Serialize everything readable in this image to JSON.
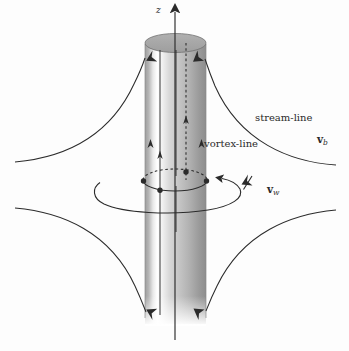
{
  "figure": {
    "background_color": "#fdfdfd",
    "ink_color": "#2b2b2b",
    "cylinder": {
      "surface_light": "#ffffff",
      "surface_mid": "#c9c9c9",
      "surface_dark": "#8f8f8f",
      "cap_fill": "#a8a8a8",
      "cap_edge": "#6f6f6f"
    }
  },
  "labels": {
    "axis_z": "z",
    "stream_line": "stream-line",
    "vortex_line": "vortex-line",
    "velocity_b": "v",
    "velocity_b_sub": "b",
    "velocity_w": "v",
    "velocity_w_sub": "w"
  },
  "geometry": {
    "cylinder_left_x": 145,
    "cylinder_right_x": 206,
    "cylinder_top_y": 40,
    "cylinder_bottom_y": 322,
    "cap_ry": 9,
    "axis_x": 175,
    "axis_top_y": 8,
    "axis_bottom_y": 340,
    "dashed_line_x": 186,
    "inner_line_left_x": 160,
    "inner_line_right_x": 176,
    "ring_center_x": 175,
    "ring_center_y": 180,
    "ring_rx": 32,
    "ring_ry": 11,
    "circulation_center_x": 167,
    "circulation_center_y": 193,
    "circulation_rx": 74,
    "circulation_ry": 20
  },
  "label_positions": {
    "axis_z": {
      "x": 156,
      "y": 7
    },
    "stream_line": {
      "x": 255,
      "y": 118
    },
    "vortex_line": {
      "x": 205,
      "y": 143
    },
    "velocity_b": {
      "x": 318,
      "y": 138
    },
    "velocity_w": {
      "x": 268,
      "y": 188
    }
  },
  "elements": {
    "vortex_dots": [
      {
        "x": 144,
        "y": 181,
        "r": 2.6
      },
      {
        "x": 206,
        "y": 181,
        "r": 2.6
      },
      {
        "x": 160,
        "y": 190,
        "r": 2.6
      },
      {
        "x": 186,
        "y": 172,
        "r": 2.6
      }
    ],
    "stream_arrow_count": 4,
    "vortex_arrow_count": 4
  }
}
